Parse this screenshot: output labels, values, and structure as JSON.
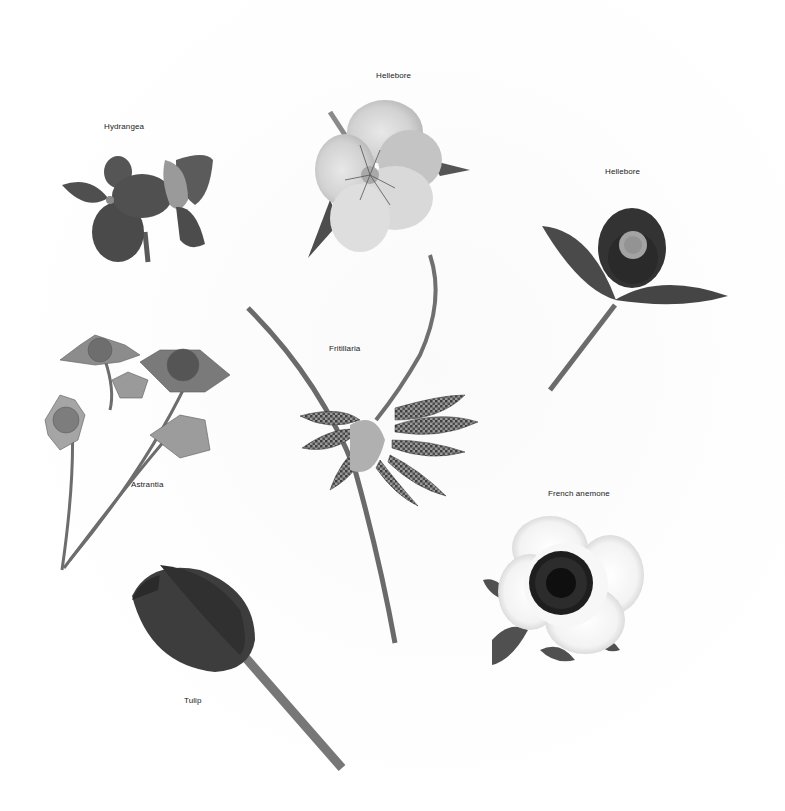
{
  "figure": {
    "type": "botanical-photo-plate",
    "color_mode": "grayscale",
    "background": "#ffffff",
    "specimens": [
      {
        "id": "hydrangea",
        "label": "Hydrangea",
        "label_pos": [
          104,
          128
        ]
      },
      {
        "id": "hellebore-top",
        "label": "Hellebore",
        "label_pos": [
          376,
          76
        ]
      },
      {
        "id": "hellebore-right",
        "label": "Hellebore",
        "label_pos": [
          605,
          172
        ]
      },
      {
        "id": "fritillaria",
        "label": "Fritillaria",
        "label_pos": [
          329,
          349
        ]
      },
      {
        "id": "astrantia",
        "label": "Astrantia",
        "label_pos": [
          131,
          485
        ]
      },
      {
        "id": "french-anemone",
        "label": "French anemone",
        "label_pos": [
          548,
          494
        ]
      },
      {
        "id": "tulip",
        "label": "Tulip",
        "label_pos": [
          184,
          700
        ]
      }
    ]
  }
}
